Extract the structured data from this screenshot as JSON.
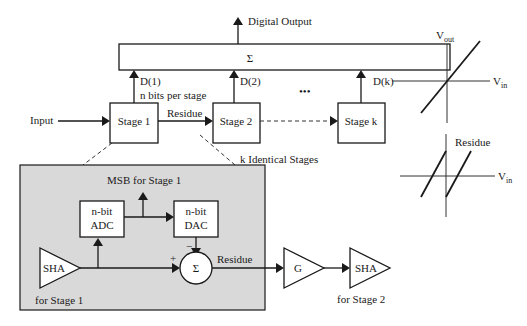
{
  "diagram": {
    "top": {
      "digital_output": "Digital Output",
      "adder_symbol": "Σ",
      "d1": "D(1)",
      "bits_note": "n bits per stage",
      "d2": "D(2)",
      "dk": "D(k)",
      "ellipsis": "•••"
    },
    "stages": {
      "input": "Input",
      "stage1": "Stage 1",
      "residue": "Residue",
      "stage2": "Stage 2",
      "stagek": "Stage k",
      "k_identical": "k Identical Stages"
    },
    "detail": {
      "msb": "MSB for Stage 1",
      "adc_l1": "n-bit",
      "adc_l2": "ADC",
      "dac_l1": "n-bit",
      "dac_l2": "DAC",
      "sha1": "SHA",
      "sha1_note": "for Stage 1",
      "plus": "+",
      "minus": "−",
      "sum": "Σ",
      "residue": "Residue",
      "gain": "G",
      "sha2": "SHA",
      "sha2_note": "for Stage 2"
    },
    "plots": {
      "vout": "V",
      "vout_sub": "out",
      "vin1": "V",
      "vin1_sub": "in",
      "residue": "Residue",
      "vin2": "V",
      "vin2_sub": "in"
    },
    "colors": {
      "detail_bg": "#d9d9d9",
      "line": "#1a1a1a"
    }
  }
}
